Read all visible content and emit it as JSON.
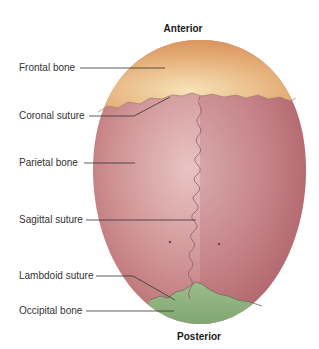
{
  "diagram": {
    "orientation": {
      "top": "Anterior",
      "bottom": "Posterior"
    },
    "labels": [
      {
        "id": "frontal-bone",
        "text": "Frontal bone"
      },
      {
        "id": "coronal-suture",
        "text": "Coronal suture"
      },
      {
        "id": "parietal-bone",
        "text": "Parietal bone"
      },
      {
        "id": "sagittal-suture",
        "text": "Sagittal suture"
      },
      {
        "id": "lambdoid-suture",
        "text": "Lambdoid suture"
      },
      {
        "id": "occipital-bone",
        "text": "Occipital bone"
      }
    ],
    "colors": {
      "frontal": "#e3a66a",
      "parietal": "#c98486",
      "occipital": "#8fae7e",
      "suture": "#8e5a78",
      "leader": "#333333"
    }
  }
}
